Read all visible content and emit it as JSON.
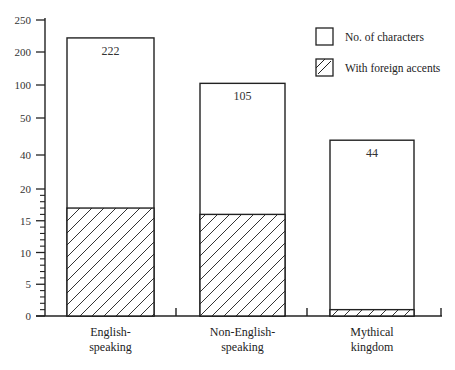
{
  "chart_data": {
    "type": "bar",
    "title": "",
    "xlabel": "",
    "ylabel": "",
    "categories": [
      "English-speaking",
      "Non-English-speaking",
      "Mythical kingdom"
    ],
    "category_lines": [
      [
        "English-",
        "speaking"
      ],
      [
        "Non-English-",
        "speaking"
      ],
      [
        "Mythical",
        "kingdom"
      ]
    ],
    "series": [
      {
        "name": "No. of characters",
        "values": [
          222,
          105,
          44
        ],
        "pattern": "none"
      },
      {
        "name": "With foreign accents",
        "values": [
          17,
          16,
          1
        ],
        "pattern": "hatched"
      }
    ],
    "data_labels": [
      "222",
      "105",
      "44"
    ],
    "y_ticks": [
      0,
      5,
      10,
      15,
      20,
      40,
      50,
      100,
      200,
      250
    ],
    "y_tick_labels": [
      "0",
      "5",
      "10",
      "15",
      "20",
      "40",
      "50",
      "100",
      "200",
      "250"
    ],
    "y_scale": "broken/non-linear (unit minor ticks from 0 to 20)",
    "ylim": [
      0,
      250
    ],
    "grid": false,
    "legend_position": "top-right"
  },
  "legend": {
    "items": [
      {
        "label": "No. of characters",
        "swatch": "empty"
      },
      {
        "label": "With foreign accents",
        "swatch": "hatched"
      }
    ]
  },
  "colors": {
    "ink": "#222222",
    "background": "#ffffff"
  }
}
